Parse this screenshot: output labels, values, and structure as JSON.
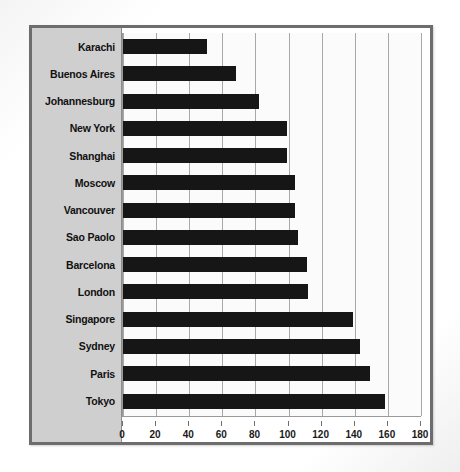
{
  "chart_data": {
    "type": "bar",
    "orientation": "horizontal",
    "title": "",
    "xlabel": "",
    "ylabel": "",
    "xlim": [
      0,
      180
    ],
    "xticks": [
      0,
      20,
      40,
      60,
      80,
      100,
      120,
      140,
      160,
      180
    ],
    "grid": true,
    "legend": false,
    "bar_color": "#161616",
    "panel_color": "#cfcfcf",
    "plot_background": "#fbfbfb",
    "gridline_color": "#a8a8a8",
    "border_color": "#6d6d6d",
    "categories": [
      "Karachi",
      "Buenos Aires",
      "Johannesburg",
      "New York",
      "Shanghai",
      "Moscow",
      "Vancouver",
      "Sao Paolo",
      "Barcelona",
      "London",
      "Singapore",
      "Sydney",
      "Paris",
      "Tokyo"
    ],
    "values": [
      51,
      68,
      82,
      99,
      99,
      104,
      104,
      106,
      111,
      112,
      139,
      143,
      149,
      158
    ]
  }
}
